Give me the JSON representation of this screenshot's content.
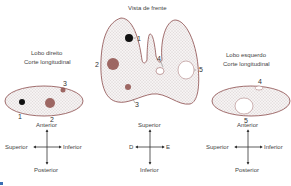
{
  "titles": {
    "front_view": "Vista de frente",
    "right_lobe_line1": "Lobo direito",
    "right_lobe_line2": "Corte longitudinal",
    "left_lobe_line1": "Lobo esquerdo",
    "left_lobe_line2": "Corte longitudinal"
  },
  "markers": {
    "front": [
      "1",
      "2",
      "3",
      "4",
      "5"
    ],
    "right": [
      "1",
      "2",
      "3"
    ],
    "left": [
      "4",
      "5"
    ]
  },
  "compass_left": {
    "top": "Anterior",
    "left": "Superior",
    "right": "Inferior",
    "bottom": "Posterior"
  },
  "compass_center": {
    "top": "Superior",
    "left": "D",
    "right": "E",
    "bottom": "Inferior"
  },
  "compass_right": {
    "top": "Anterior",
    "left": "Superior",
    "right": "Inferior",
    "bottom": "Posterior"
  },
  "colors": {
    "outline": "#8a4a4a",
    "stipple": "#b7a9a9",
    "nodule_brown": "#8e4f4a",
    "nodule_black": "#111111"
  }
}
